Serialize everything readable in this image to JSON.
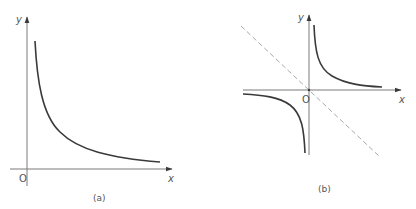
{
  "colors": {
    "background": "#ffffff",
    "axis": "#7a7a7a",
    "curve": "#3a3a3a",
    "asymptote_dashed": "#a8a8a8",
    "text": "#555555"
  },
  "panels": [
    {
      "id": "a",
      "caption": "(a)",
      "x_axis_label": "x",
      "y_axis_label": "y",
      "origin_label": "O",
      "description": "Branch of a rectangular hyperbola in the first quadrant, decreasing curve asymptotic to both positive axes"
    },
    {
      "id": "b",
      "caption": "(b)",
      "x_axis_label": "x",
      "y_axis_label": "y",
      "origin_label": "O",
      "description": "Both branches of a rectangular hyperbola in the first and third quadrants, with a dashed line through the origin (axis of symmetry y = -x)"
    }
  ]
}
